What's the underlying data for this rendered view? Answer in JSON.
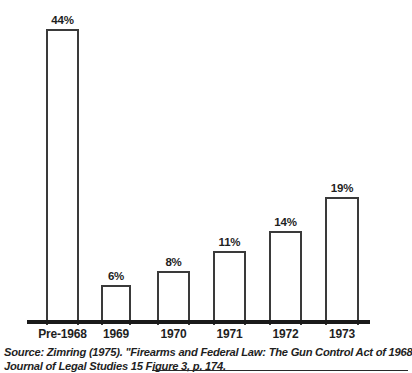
{
  "chart_data": {
    "type": "bar",
    "title": "",
    "subtitle": "",
    "xlabel": "",
    "ylabel": "",
    "ylim": [
      0,
      44
    ],
    "grid": false,
    "legend": "none",
    "categories": [
      "Pre-1968",
      "1969",
      "1970",
      "1971",
      "1972",
      "1973"
    ],
    "values": [
      44,
      6,
      8,
      11,
      14,
      19
    ],
    "value_labels": [
      "44%",
      "8%",
      "8%",
      "11%",
      "14%",
      "19%"
    ],
    "bar_style": {
      "fill": "#ffffff",
      "outline": "#3a3a3a",
      "axis_color": "#1a1a1a"
    }
  },
  "bars": [
    {
      "category": "Pre-1968",
      "value": 44,
      "label": "44%",
      "left": 46,
      "width": 33
    },
    {
      "category": "1969",
      "value": 6,
      "label": "6%",
      "left": 101,
      "width": 30
    },
    {
      "category": "1970",
      "value": 8,
      "label": "8%",
      "left": 157,
      "width": 33
    },
    {
      "category": "1971",
      "value": 11,
      "label": "11%",
      "left": 213,
      "width": 33
    },
    {
      "category": "1972",
      "value": 14,
      "label": "14%",
      "left": 269,
      "width": 33
    },
    {
      "category": "1973",
      "value": 19,
      "label": "19%",
      "left": 325,
      "width": 34
    }
  ],
  "source": {
    "line1": "Source: Zimring (1975). ''Firearms and Federal Law: The Gun Control Act of 1968.''",
    "line2": "Journal of Legal Studies 15 Figure 3, p. 174."
  }
}
